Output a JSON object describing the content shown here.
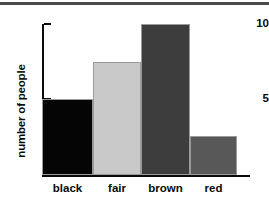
{
  "chart_data": {
    "type": "bar",
    "title": "",
    "subtitle": "",
    "xlabel": "",
    "ylabel": "number of people",
    "categories": [
      "black",
      "fair",
      "brown",
      "red"
    ],
    "values": [
      5,
      7.5,
      10,
      2.6
    ],
    "series": [
      {
        "name": "number of people",
        "values": [
          5,
          7.5,
          10,
          2.6
        ]
      }
    ],
    "ylim": [
      0,
      10
    ],
    "ytick_labels": [
      "5",
      "10"
    ],
    "ytick_values": [
      5,
      10
    ],
    "xtick_labels": [
      "black",
      "fair",
      "brown",
      "red"
    ],
    "grid": false,
    "legend": false,
    "legend_position": "none",
    "annotations": [],
    "bar_colors": [
      "#050505",
      "#c9c9c9",
      "#3d3d3d",
      "#585858"
    ],
    "bar_edge_color": "#9a9a9a",
    "axis_color": "#0a0a0a",
    "background_color": "#ffffff",
    "top_rule_color": "#4a4a4a"
  }
}
